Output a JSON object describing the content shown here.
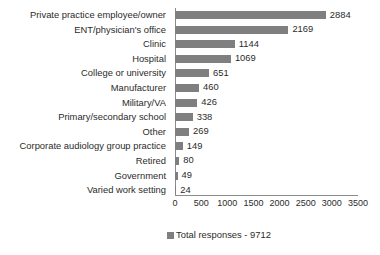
{
  "chart_data": {
    "type": "bar",
    "orientation": "horizontal",
    "title": "",
    "xlabel": "",
    "ylabel": "",
    "xlim": [
      0,
      3500
    ],
    "xticks": [
      0,
      500,
      1000,
      1500,
      2000,
      2500,
      3000,
      3500
    ],
    "grid": false,
    "legend_position": "bottom",
    "legend": [
      "Total responses - 9712"
    ],
    "series_color": "#7f7f7f",
    "categories": [
      "Private practice employee/owner",
      "ENT/physician's office",
      "Clinic",
      "Hospital",
      "College or university",
      "Manufacturer",
      "Military/VA",
      "Primary/secondary school",
      "Other",
      "Corporate audiology group practice",
      "Retired",
      "Government",
      "Varied work setting"
    ],
    "values": [
      2884,
      2169,
      1144,
      1069,
      651,
      460,
      426,
      338,
      269,
      149,
      80,
      49,
      24
    ],
    "value_labels": [
      "2884",
      "2169",
      "1144",
      "1069",
      "651",
      "460",
      "426",
      "338",
      "269",
      "149",
      "80",
      "49",
      "24"
    ],
    "series": [
      {
        "name": "Total responses - 9712",
        "values": [
          2884,
          2169,
          1144,
          1069,
          651,
          460,
          426,
          338,
          269,
          149,
          80,
          49,
          24
        ]
      }
    ]
  },
  "legend": {
    "label": "Total responses - 9712"
  }
}
